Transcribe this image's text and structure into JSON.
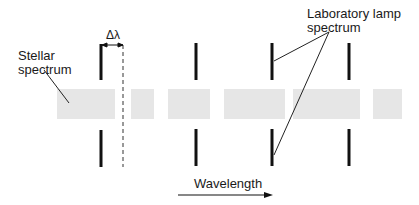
{
  "labels": {
    "delta_lambda": "Δλ",
    "stellar_line1": "Stellar",
    "stellar_line2": "spectrum",
    "lab_line1": "Laboratory lamp",
    "lab_line2": "spectrum",
    "wavelength": "Wavelength"
  },
  "colors": {
    "spectrum_fill": "#e6e6e6",
    "line": "#111111",
    "text": "#1a1a1a"
  },
  "stellar_spectrum_segments": [
    {
      "x": 57,
      "w": 58
    },
    {
      "x": 131,
      "w": 23
    },
    {
      "x": 168,
      "w": 42
    },
    {
      "x": 224,
      "w": 61
    },
    {
      "x": 293,
      "w": 67
    },
    {
      "x": 373,
      "w": 29
    }
  ],
  "lamp_lines_x": [
    101,
    196,
    272,
    349
  ],
  "shift_reference_x": 123
}
